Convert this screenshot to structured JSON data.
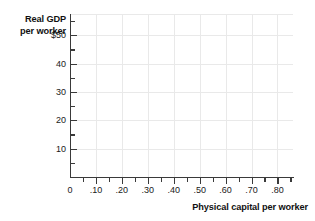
{
  "chart_data": {
    "type": "scatter",
    "title": "",
    "subtitle": "",
    "xlabel": "Physical capital per worker",
    "ylabel_line1": "Real GDP",
    "ylabel_line2": "per worker",
    "ylabel": "Real GDP per worker",
    "xlim": [
      0,
      0.86
    ],
    "ylim": [
      0,
      57.5
    ],
    "grid": true,
    "legend": null,
    "series": [],
    "values": [],
    "x": [],
    "annotations": [],
    "x_ticks_major": [
      {
        "value": 0,
        "label": "0"
      },
      {
        "value": 0.1,
        "label": ".10"
      },
      {
        "value": 0.2,
        "label": ".20"
      },
      {
        "value": 0.3,
        "label": ".30"
      },
      {
        "value": 0.4,
        "label": ".40"
      },
      {
        "value": 0.5,
        "label": ".50"
      },
      {
        "value": 0.6,
        "label": ".60"
      },
      {
        "value": 0.7,
        "label": ".70"
      },
      {
        "value": 0.8,
        "label": ".80"
      }
    ],
    "x_ticks_minor": [
      0.05,
      0.15,
      0.25,
      0.35,
      0.45,
      0.55,
      0.65,
      0.75,
      0.85
    ],
    "y_ticks_major": [
      {
        "value": 50,
        "label": "$50"
      },
      {
        "value": 40,
        "label": "40"
      },
      {
        "value": 30,
        "label": "30"
      },
      {
        "value": 20,
        "label": "20"
      },
      {
        "value": 10,
        "label": "10"
      }
    ],
    "y_ticks_minor": [
      5,
      15,
      25,
      35,
      45,
      55
    ],
    "colors": {
      "axis": "#3a3a3a",
      "gridline": "#e9e9e9",
      "text": "#1a1a1a",
      "title_text": "#111111",
      "background": "#ffffff"
    }
  }
}
